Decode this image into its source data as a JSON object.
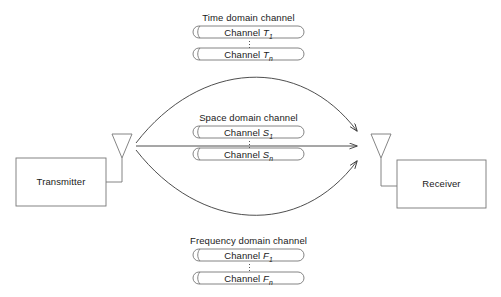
{
  "diagram": {
    "background_color": "#ffffff",
    "stroke_color": "#4d4d4d",
    "text_color": "#1a1a1a",
    "nodes": {
      "transmitter": {
        "label": "Transmitter"
      },
      "receiver": {
        "label": "Receiver"
      }
    },
    "icons": {
      "tx_antenna": "antenna-icon",
      "rx_antenna": "antenna-icon"
    },
    "channel_groups": [
      {
        "id": "time",
        "title": "Time domain channel",
        "channels": [
          {
            "name": "Channel",
            "symbol": "T",
            "index": "1"
          },
          {
            "name": "Channel",
            "symbol": "T",
            "index": "n"
          }
        ],
        "ellipsis": "⋮"
      },
      {
        "id": "space",
        "title": "Space domain channel",
        "channels": [
          {
            "name": "Channel",
            "symbol": "S",
            "index": "1"
          },
          {
            "name": "Channel",
            "symbol": "S",
            "index": "n"
          }
        ],
        "ellipsis": "⋮"
      },
      {
        "id": "frequency",
        "title": "Frequency domain channel",
        "channels": [
          {
            "name": "Channel",
            "symbol": "F",
            "index": "1"
          },
          {
            "name": "Channel",
            "symbol": "F",
            "index": "n"
          }
        ],
        "ellipsis": "⋮"
      }
    ],
    "links": [
      {
        "id": "upper-arc",
        "from": "transmitter-antenna",
        "to": "receiver-antenna",
        "style": "curved-arrow"
      },
      {
        "id": "middle-line",
        "from": "transmitter-antenna",
        "to": "receiver-antenna",
        "style": "straight-arrow"
      },
      {
        "id": "lower-arc",
        "from": "transmitter-antenna",
        "to": "receiver-antenna",
        "style": "curved-arrow"
      }
    ]
  }
}
